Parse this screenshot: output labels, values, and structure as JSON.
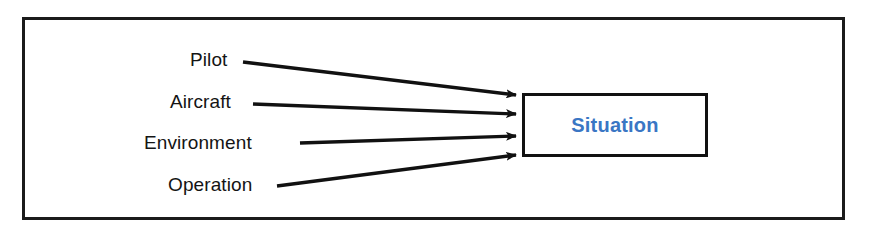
{
  "figure": {
    "type": "concept-diagram",
    "frame_color": "#1b1b1b",
    "background_color": "#ffffff"
  },
  "sources": [
    {
      "id": "pilot",
      "label": "Pilot"
    },
    {
      "id": "aircraft",
      "label": "Aircraft"
    },
    {
      "id": "environment",
      "label": "Environment"
    },
    {
      "id": "operation",
      "label": "Operation"
    }
  ],
  "target": {
    "label": "Situation",
    "text_color": "#3a76c4",
    "border_color": "#111111",
    "fill_color": "#ffffff"
  },
  "connectors": {
    "count": 4,
    "style": "solid-arrow",
    "color": "#111111",
    "direction": "left-to-right-converging"
  }
}
